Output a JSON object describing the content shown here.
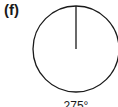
{
  "figure": {
    "panel_label": "(f)",
    "angle_label": "275°",
    "circle": {
      "cx": 76,
      "cy": 49,
      "r": 43,
      "stroke": "#1a1a1a"
    },
    "hand": {
      "x1": 76,
      "y1": 6,
      "x2": 76,
      "y2": 49,
      "stroke": "#1a1a1a"
    }
  }
}
